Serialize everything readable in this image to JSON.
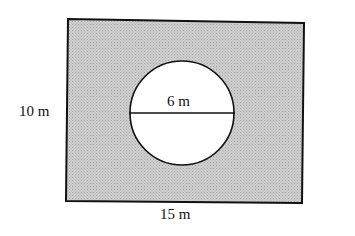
{
  "diagram": {
    "colors": {
      "shade": "#c8c8c8",
      "stroke": "#111111",
      "hole": "#ffffff"
    },
    "rectangle": {
      "width_label": "15 m",
      "height_label": "10 m"
    },
    "circle": {
      "diameter_label": "6 m"
    }
  }
}
